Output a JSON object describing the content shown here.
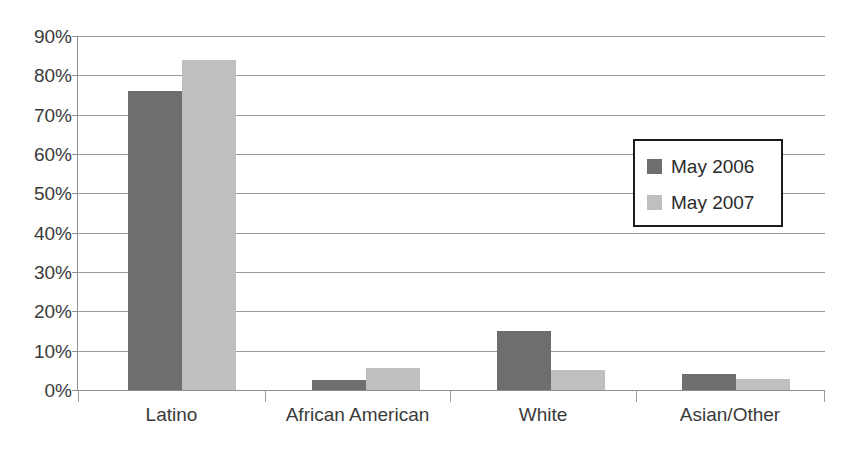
{
  "chart_data": {
    "type": "bar",
    "title": "",
    "clipped_top_text": "",
    "xlabel": "",
    "ylabel": "",
    "categories": [
      "Latino",
      "African American",
      "White",
      "Asian/Other"
    ],
    "series": [
      {
        "name": "May 2006",
        "color": "#6e6e6e",
        "values": [
          76,
          2.5,
          15,
          4
        ]
      },
      {
        "name": "May 2007",
        "color": "#bfbfbf",
        "values": [
          84,
          5.5,
          5,
          2.8
        ]
      }
    ],
    "ylim": [
      0,
      90
    ],
    "ytick_values": [
      0,
      10,
      20,
      30,
      40,
      50,
      60,
      70,
      80,
      90
    ],
    "ytick_labels": [
      "0%",
      "10%",
      "20%",
      "30%",
      "40%",
      "50%",
      "60%",
      "70%",
      "80%",
      "90%"
    ],
    "grid": true,
    "grid_axis": "y",
    "legend_position": "inside-right",
    "legend_border_color": "#1c1c1c",
    "value_format": "percent",
    "background": "#ffffff"
  },
  "axes": {
    "y_label_color": "#3a3a3a",
    "x_label_color": "#3a3a3a",
    "gridline_color": "#9a9a9a"
  }
}
